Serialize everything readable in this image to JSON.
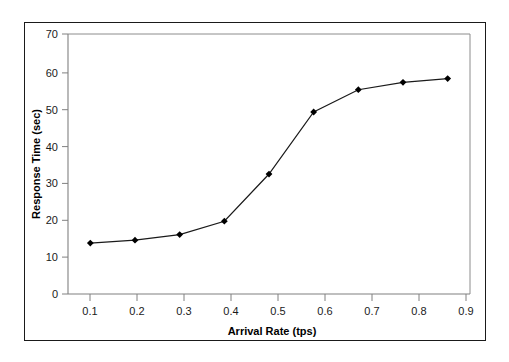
{
  "chart_data": {
    "type": "line",
    "title": "",
    "xlabel": "Arrival Rate (tps)",
    "ylabel": "Response Time (sec)",
    "x": [
      0.1,
      0.2,
      0.3,
      0.4,
      0.5,
      0.6,
      0.7,
      0.8,
      0.9
    ],
    "values": [
      13.7,
      14.5,
      16.0,
      19.6,
      32.3,
      49.0,
      55.0,
      57.0,
      58.0
    ],
    "xtick_labels": [
      "0.1",
      "0.2",
      "0.3",
      "0.4",
      "0.5",
      "0.6",
      "0.7",
      "0.8",
      "0.9"
    ],
    "ytick_labels": [
      "0",
      "10",
      "20",
      "30",
      "40",
      "50",
      "60",
      "70"
    ],
    "ytick_values": [
      0,
      10,
      20,
      30,
      40,
      50,
      60,
      70
    ],
    "xlim": [
      0.05,
      0.95
    ],
    "ylim": [
      0,
      70
    ],
    "grid": false,
    "legend": null,
    "series_name": "Response Time",
    "marker": "filled-diamond",
    "line_color": "#1a1a1a",
    "marker_color": "#000000",
    "axis_color": "#808080",
    "frame_color": "#1a1a1a",
    "background": "#ffffff"
  }
}
